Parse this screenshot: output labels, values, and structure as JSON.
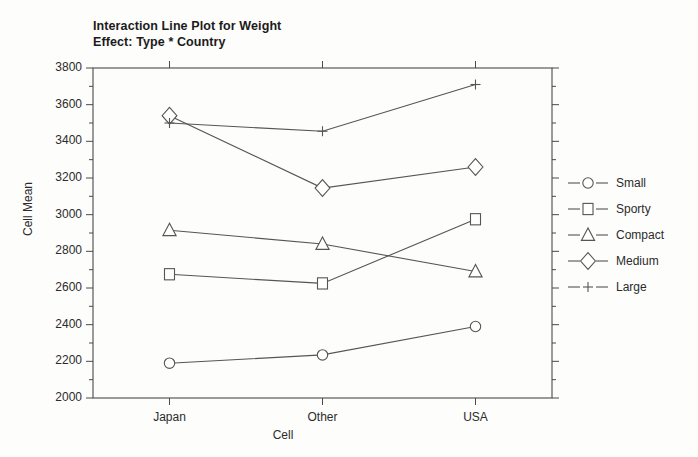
{
  "title": {
    "line1": "Interaction Line Plot for Weight",
    "line2": "Effect: Type * Country"
  },
  "axes": {
    "ylabel": "Cell Mean",
    "xlabel": "Cell",
    "ytick_labels": [
      "3800",
      "3600",
      "3400",
      "3200",
      "3000",
      "2800",
      "2600",
      "2400",
      "2200",
      "2000"
    ],
    "xtick_labels": [
      "Japan",
      "Other",
      "USA"
    ]
  },
  "legend": {
    "entries": [
      {
        "label": "Small",
        "marker": "circle-marker"
      },
      {
        "label": "Sporty",
        "marker": "square-marker"
      },
      {
        "label": "Compact",
        "marker": "triangle-marker"
      },
      {
        "label": "Medium",
        "marker": "diamond-marker"
      },
      {
        "label": "Large",
        "marker": "plus-marker"
      }
    ]
  },
  "colors": {
    "line": "#555555",
    "axis": "#4a4a4a",
    "text": "#2b2b2b",
    "background": "#fdfdfc"
  },
  "chart_data": {
    "type": "line",
    "title": "Interaction Line Plot for Weight Effect: Type * Country",
    "xlabel": "Cell",
    "ylabel": "Cell Mean",
    "categories": [
      "Japan",
      "Other",
      "USA"
    ],
    "ylim": [
      2000,
      3800
    ],
    "ytick_step": 200,
    "yminor_step": 100,
    "grid": false,
    "legend_position": "right",
    "series": [
      {
        "name": "Small",
        "marker": "circle",
        "values": [
          2190,
          2235,
          2390
        ]
      },
      {
        "name": "Sporty",
        "marker": "square",
        "values": [
          2675,
          2625,
          2975
        ]
      },
      {
        "name": "Compact",
        "marker": "triangle",
        "values": [
          2915,
          2840,
          2690
        ]
      },
      {
        "name": "Medium",
        "marker": "diamond",
        "values": [
          3540,
          3145,
          3260
        ]
      },
      {
        "name": "Large",
        "marker": "plus",
        "values": [
          3500,
          3455,
          3710
        ]
      }
    ]
  }
}
